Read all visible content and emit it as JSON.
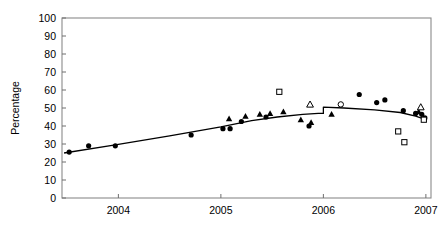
{
  "chart_data": {
    "type": "scatter",
    "title": "",
    "xlabel": "",
    "ylabel": "Percentage",
    "xlim": [
      2003.45,
      2007.05
    ],
    "ylim": [
      0,
      100
    ],
    "grid": false,
    "legend_position": "none",
    "yticks": [
      0,
      10,
      20,
      30,
      40,
      50,
      60,
      70,
      80,
      90,
      100
    ],
    "ytick_labels": [
      "0",
      "10",
      "20",
      "30",
      "40",
      "50",
      "60",
      "70",
      "80",
      "90",
      "100"
    ],
    "xticks": [
      2004,
      2005,
      2006,
      2007
    ],
    "xtick_labels": [
      "2004",
      "2005",
      "2006",
      "2007"
    ],
    "series": [
      {
        "name": "filled-circle",
        "marker": "filled-circle",
        "points": [
          {
            "x": 2003.52,
            "y": 25.5
          },
          {
            "x": 2003.71,
            "y": 29.0
          },
          {
            "x": 2003.97,
            "y": 29.0
          },
          {
            "x": 2004.71,
            "y": 35.0
          },
          {
            "x": 2005.02,
            "y": 38.5
          },
          {
            "x": 2005.09,
            "y": 38.5
          },
          {
            "x": 2005.2,
            "y": 42.5
          },
          {
            "x": 2005.44,
            "y": 45.0
          },
          {
            "x": 2005.86,
            "y": 40.0
          },
          {
            "x": 2006.35,
            "y": 57.5
          },
          {
            "x": 2006.52,
            "y": 53.0
          },
          {
            "x": 2006.6,
            "y": 54.5
          },
          {
            "x": 2006.78,
            "y": 48.5
          },
          {
            "x": 2006.9,
            "y": 47.0
          },
          {
            "x": 2006.96,
            "y": 46.5
          },
          {
            "x": 2006.99,
            "y": 44.5
          }
        ]
      },
      {
        "name": "filled-triangle",
        "marker": "filled-triangle",
        "points": [
          {
            "x": 2005.08,
            "y": 44.0
          },
          {
            "x": 2005.24,
            "y": 45.5
          },
          {
            "x": 2005.38,
            "y": 46.5
          },
          {
            "x": 2005.48,
            "y": 47.0
          },
          {
            "x": 2005.61,
            "y": 48.0
          },
          {
            "x": 2005.78,
            "y": 43.5
          },
          {
            "x": 2005.88,
            "y": 42.0
          },
          {
            "x": 2006.08,
            "y": 46.5
          },
          {
            "x": 2006.93,
            "y": 48.0
          }
        ]
      },
      {
        "name": "open-square",
        "marker": "open-square",
        "points": [
          {
            "x": 2005.57,
            "y": 59.0
          },
          {
            "x": 2006.73,
            "y": 37.0
          },
          {
            "x": 2006.79,
            "y": 31.0
          },
          {
            "x": 2006.98,
            "y": 43.5
          }
        ]
      },
      {
        "name": "open-triangle",
        "marker": "open-triangle",
        "points": [
          {
            "x": 2005.87,
            "y": 52.0
          },
          {
            "x": 2006.95,
            "y": 50.5
          }
        ]
      },
      {
        "name": "open-circle",
        "marker": "open-circle",
        "points": [
          {
            "x": 2006.17,
            "y": 52.0
          }
        ]
      }
    ],
    "trend_line": {
      "name": "fitted-trend-line",
      "style": "solid",
      "points": [
        {
          "x": 2003.47,
          "y": 25.0
        },
        {
          "x": 2003.97,
          "y": 29.5
        },
        {
          "x": 2004.5,
          "y": 34.5
        },
        {
          "x": 2005.0,
          "y": 39.5
        },
        {
          "x": 2005.3,
          "y": 43.0
        },
        {
          "x": 2005.55,
          "y": 45.0
        },
        {
          "x": 2005.8,
          "y": 46.5
        },
        {
          "x": 2005.95,
          "y": 47.0
        },
        {
          "x": 2006.0,
          "y": 47.0
        },
        {
          "x": 2006.0,
          "y": 50.5
        },
        {
          "x": 2006.2,
          "y": 50.0
        },
        {
          "x": 2006.5,
          "y": 49.0
        },
        {
          "x": 2006.75,
          "y": 47.5
        },
        {
          "x": 2006.9,
          "y": 45.5
        },
        {
          "x": 2007.0,
          "y": 43.5
        }
      ]
    }
  }
}
